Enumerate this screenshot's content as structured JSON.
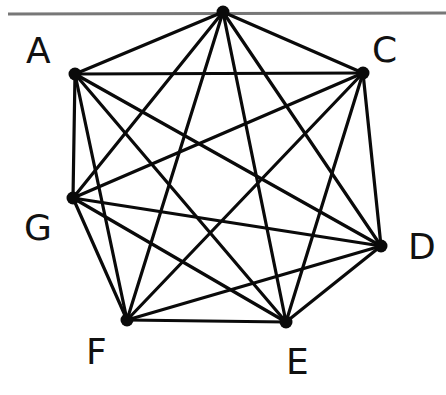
{
  "diagram": {
    "type": "complete-graph",
    "name": "K7",
    "top_rule": {
      "x1": 8,
      "y1": 14,
      "x2": 446,
      "y2": 13,
      "color": "#777777",
      "width": 3
    },
    "edge_color": "#0a0a0a",
    "vertices": [
      {
        "id": "T",
        "label": "",
        "x": 223,
        "y": 12
      },
      {
        "id": "A",
        "label": "A",
        "x": 75,
        "y": 74,
        "lx": 26,
        "ly": 63
      },
      {
        "id": "C",
        "label": "C",
        "x": 363,
        "y": 73,
        "lx": 372,
        "ly": 62
      },
      {
        "id": "G",
        "label": "G",
        "x": 73,
        "y": 198,
        "lx": 24,
        "ly": 240
      },
      {
        "id": "D",
        "label": "D",
        "x": 381,
        "y": 246,
        "lx": 408,
        "ly": 259
      },
      {
        "id": "E",
        "label": "E",
        "x": 286,
        "y": 322,
        "lx": 286,
        "ly": 374
      },
      {
        "id": "F",
        "label": "F",
        "x": 127,
        "y": 320,
        "lx": 86,
        "ly": 364
      }
    ],
    "edges": [
      [
        "T",
        "A"
      ],
      [
        "T",
        "C"
      ],
      [
        "T",
        "G"
      ],
      [
        "T",
        "D"
      ],
      [
        "T",
        "E"
      ],
      [
        "T",
        "F"
      ],
      [
        "A",
        "C"
      ],
      [
        "A",
        "G"
      ],
      [
        "A",
        "D"
      ],
      [
        "A",
        "E"
      ],
      [
        "A",
        "F"
      ],
      [
        "C",
        "G"
      ],
      [
        "C",
        "D"
      ],
      [
        "C",
        "E"
      ],
      [
        "C",
        "F"
      ],
      [
        "G",
        "D"
      ],
      [
        "G",
        "E"
      ],
      [
        "G",
        "F"
      ],
      [
        "D",
        "E"
      ],
      [
        "D",
        "F"
      ],
      [
        "E",
        "F"
      ]
    ]
  }
}
